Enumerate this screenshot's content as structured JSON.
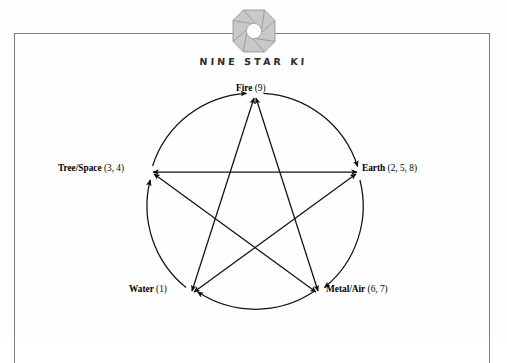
{
  "page": {
    "background_color": "#ffffff",
    "frame_color": "#7e7e80"
  },
  "header": {
    "logo_name": "nine-star-ki-octagon-logo",
    "logo_color": "#b9b9b9",
    "logo_center_color": "#ffffff",
    "title": "NINE STAR KI"
  },
  "diagram": {
    "type": "five-element-cycle-pentagram",
    "stroke_color": "#1a1a1a",
    "nodes": [
      {
        "id": "fire",
        "name": "Fire",
        "numbers": "(9)",
        "position": "top"
      },
      {
        "id": "earth",
        "name": "Earth",
        "numbers": "(2, 5, 8)",
        "position": "right"
      },
      {
        "id": "metal",
        "name": "Metal/Air",
        "numbers": "(6, 7)",
        "position": "bottom-right"
      },
      {
        "id": "water",
        "name": "Water",
        "numbers": "(1)",
        "position": "bottom-left"
      },
      {
        "id": "tree",
        "name": "Tree/Space",
        "numbers": "(3, 4)",
        "position": "left"
      }
    ],
    "creative_cycle": [
      {
        "from": "tree",
        "to": "fire",
        "style": "arc-arrow"
      },
      {
        "from": "fire",
        "to": "earth",
        "style": "arc-arrow"
      },
      {
        "from": "earth",
        "to": "metal",
        "style": "arc-arrow"
      },
      {
        "from": "metal",
        "to": "water",
        "style": "arc-arrow"
      },
      {
        "from": "water",
        "to": "tree",
        "style": "arc-arrow"
      }
    ],
    "controlling_cycle": [
      {
        "from": "fire",
        "to": "metal",
        "style": "double-arrow"
      },
      {
        "from": "metal",
        "to": "tree",
        "style": "double-arrow"
      },
      {
        "from": "tree",
        "to": "earth",
        "style": "double-arrow"
      },
      {
        "from": "earth",
        "to": "water",
        "style": "double-arrow"
      },
      {
        "from": "water",
        "to": "fire",
        "style": "double-arrow"
      }
    ]
  }
}
